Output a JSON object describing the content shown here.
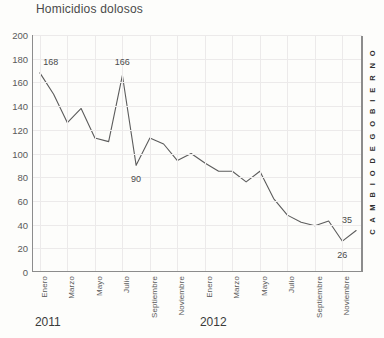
{
  "chart_data": {
    "type": "line",
    "title": "Homicidios dolosos",
    "xlabel": "",
    "ylabel": "",
    "ylim": [
      0,
      200
    ],
    "ytick_step": 20,
    "yticks": [
      200,
      180,
      160,
      140,
      120,
      100,
      80,
      60,
      40,
      20,
      0
    ],
    "grid": true,
    "legend": null,
    "line_color": "#5c5c5c",
    "x": [
      "Enero 2011",
      "Febrero 2011",
      "Marzo 2011",
      "Abril 2011",
      "Mayo 2011",
      "Junio 2011",
      "Julio 2011",
      "Agosto 2011",
      "Septiembre 2011",
      "Octubre 2011",
      "Noviembre 2011",
      "Diciembre 2011",
      "Enero 2012",
      "Febrero 2012",
      "Marzo 2012",
      "Abril 2012",
      "Mayo 2012",
      "Junio 2012",
      "Julio 2012",
      "Agosto 2012",
      "Septiembre 2012",
      "Octubre 2012",
      "Noviembre 2012",
      "Diciembre 2012"
    ],
    "values": [
      168,
      150,
      126,
      138,
      113,
      110,
      166,
      90,
      113,
      108,
      94,
      100,
      92,
      85,
      85,
      76,
      85,
      62,
      48,
      42,
      39,
      43,
      26,
      35
    ],
    "tick_labels_shown": [
      "Enero",
      "Marzo",
      "Mayo",
      "Julio",
      "Septiembre",
      "Noviembre",
      "Enero",
      "Marzo",
      "Mayo",
      "Julio",
      "Septiembre",
      "Noviembre"
    ],
    "tick_label_indices": [
      0,
      2,
      4,
      6,
      8,
      10,
      12,
      14,
      16,
      18,
      20,
      22
    ],
    "year_groups": [
      {
        "label": "2011",
        "start_index": 0
      },
      {
        "label": "2012",
        "start_index": 12
      }
    ],
    "annotations": [
      {
        "label": "168",
        "index": 0,
        "value": 168,
        "position": "above-right"
      },
      {
        "label": "166",
        "index": 6,
        "value": 166,
        "position": "above"
      },
      {
        "label": "90",
        "index": 7,
        "value": 90,
        "position": "below"
      },
      {
        "label": "26",
        "index": 22,
        "value": 26,
        "position": "below"
      },
      {
        "label": "35",
        "index": 23,
        "value": 35,
        "position": "above-left"
      }
    ],
    "marker_text": "C A M B I O   D E   G O B I E R N O",
    "marker_position_index": 23
  }
}
